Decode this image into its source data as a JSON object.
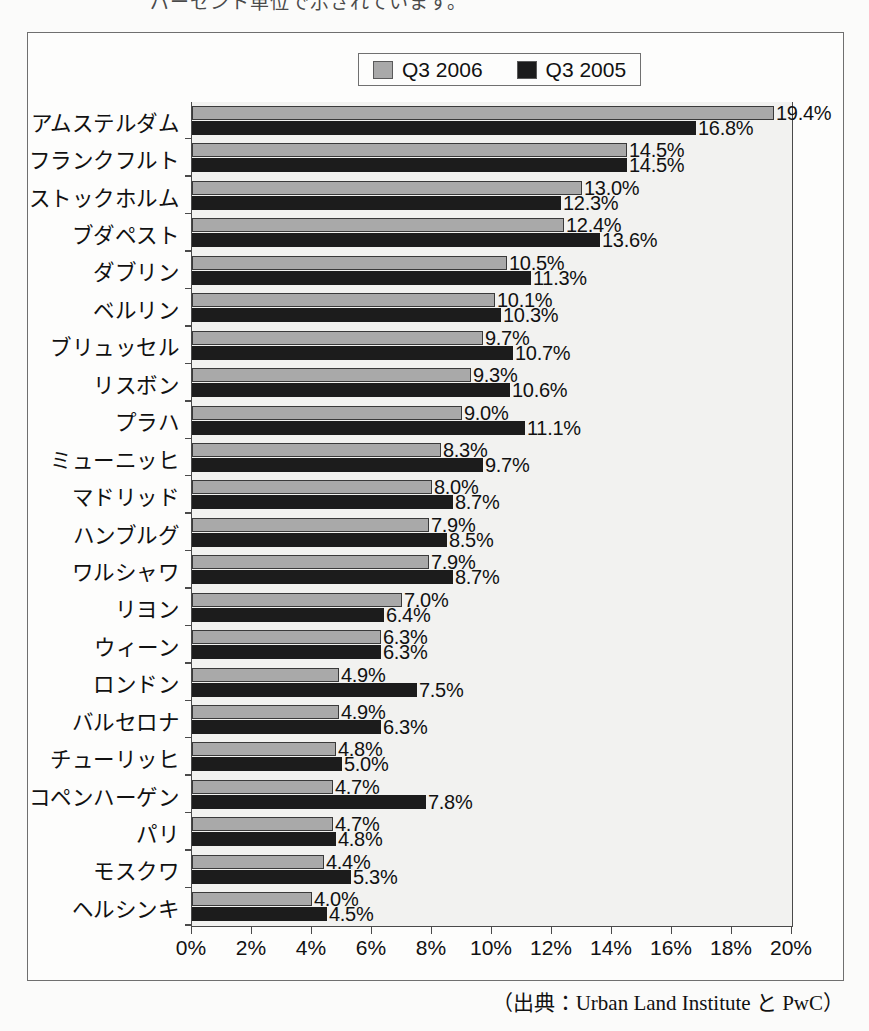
{
  "top_cropped_text": "パーセント単位で示されています。",
  "legend": {
    "entries": [
      {
        "label": "Q3 2006",
        "color": "#a9a9a9",
        "swatch_name": "legend-swatch-2006"
      },
      {
        "label": "Q3 2005",
        "color": "#1c1c1c",
        "swatch_name": "legend-swatch-2005"
      }
    ]
  },
  "source": "（出典：Urban Land Institute と PwC）",
  "chart_data": {
    "type": "bar",
    "orientation": "horizontal",
    "title": "",
    "xlabel": "",
    "ylabel": "",
    "xlim": [
      0,
      20
    ],
    "xticks": [
      "0%",
      "2%",
      "4%",
      "6%",
      "8%",
      "10%",
      "12%",
      "14%",
      "16%",
      "18%",
      "20%"
    ],
    "xtick_values": [
      0,
      2,
      4,
      6,
      8,
      10,
      12,
      14,
      16,
      18,
      20
    ],
    "grid": false,
    "legend_position": "top-center",
    "value_suffix": "%",
    "categories": [
      "アムステルダム",
      "フランクフルト",
      "ストックホルム",
      "ブダペスト",
      "ダブリン",
      "ベルリン",
      "ブリュッセル",
      "リスボン",
      "プラハ",
      "ミューニッヒ",
      "マドリッド",
      "ハンブルグ",
      "ワルシャワ",
      "リヨン",
      "ウィーン",
      "ロンドン",
      "バルセロナ",
      "チューリッヒ",
      "コペンハーゲン",
      "パリ",
      "モスクワ",
      "ヘルシンキ"
    ],
    "series": [
      {
        "name": "Q3 2006",
        "color": "#a9a9a9",
        "values": [
          19.4,
          14.5,
          13.0,
          12.4,
          10.5,
          10.1,
          9.7,
          9.3,
          9.0,
          8.3,
          8.0,
          7.9,
          7.9,
          7.0,
          6.3,
          4.9,
          4.9,
          4.8,
          4.7,
          4.7,
          4.4,
          4.0
        ],
        "labels": [
          "19.4%",
          "14.5%",
          "13.0%",
          "12.4%",
          "10.5%",
          "10.1%",
          "9.7%",
          "9.3%",
          "9.0%",
          "8.3%",
          "8.0%",
          "7.9%",
          "7.9%",
          "7.0%",
          "6.3%",
          "4.9%",
          "4.9%",
          "4.8%",
          "4.7%",
          "4.7%",
          "4.4%",
          "4.0%"
        ]
      },
      {
        "name": "Q3 2005",
        "color": "#1c1c1c",
        "values": [
          16.8,
          14.5,
          12.3,
          13.6,
          11.3,
          10.3,
          10.7,
          10.6,
          11.1,
          9.7,
          8.7,
          8.5,
          8.7,
          6.4,
          6.3,
          7.5,
          6.3,
          5.0,
          7.8,
          4.8,
          5.3,
          4.5
        ],
        "labels": [
          "16.8%",
          "14.5%",
          "12.3%",
          "13.6%",
          "11.3%",
          "10.3%",
          "10.7%",
          "10.6%",
          "11.1%",
          "9.7%",
          "8.7%",
          "8.5%",
          "8.7%",
          "6.4%",
          "6.3%",
          "7.5%",
          "6.3%",
          "5.0%",
          "7.8%",
          "4.8%",
          "5.3%",
          "4.5%"
        ]
      }
    ]
  }
}
